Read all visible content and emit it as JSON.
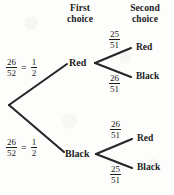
{
  "figure": {
    "type": "tree-diagram"
  },
  "headers": {
    "first": {
      "line1": "First",
      "line2": "choice"
    },
    "second": {
      "line1": "Second",
      "line2": "choice"
    }
  },
  "tree": {
    "root": {
      "x": 9,
      "y": 105
    },
    "branches": [
      {
        "id": "red",
        "label": "Red",
        "probability": {
          "numerator": "26",
          "denominator": "52",
          "equals": "=",
          "simplified_numerator": "1",
          "simplified_denominator": "2"
        },
        "children": [
          {
            "id": "red-red",
            "label": "Red",
            "probability": {
              "numerator": "25",
              "denominator": "51"
            }
          },
          {
            "id": "red-black",
            "label": "Black",
            "probability": {
              "numerator": "26",
              "denominator": "51"
            }
          }
        ]
      },
      {
        "id": "black",
        "label": "Black",
        "probability": {
          "numerator": "26",
          "denominator": "52",
          "equals": "=",
          "simplified_numerator": "1",
          "simplified_denominator": "2"
        },
        "children": [
          {
            "id": "black-red",
            "label": "Red",
            "probability": {
              "numerator": "26",
              "denominator": "51"
            }
          },
          {
            "id": "black-black",
            "label": "Black",
            "probability": {
              "numerator": "25",
              "denominator": "51"
            }
          }
        ]
      }
    ]
  },
  "colors": {
    "ink": "#1b1b1b",
    "paper": "#fdfdfc"
  }
}
